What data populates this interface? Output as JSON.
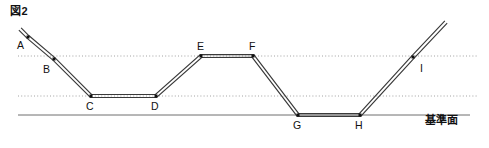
{
  "figure": {
    "title": "図2",
    "width": 489,
    "height": 148,
    "background": "#ffffff",
    "line_color": "#3a3a3a",
    "guide_color": "#8a8a8a",
    "datum_color": "#6e6e6e",
    "text_color": "#111111"
  },
  "datum": {
    "label": "基準面",
    "label_x": 441,
    "label_y": 124,
    "line_y": 115,
    "line_x1": 18,
    "line_x2": 470
  },
  "guides": [
    {
      "name": "upper-guide-line",
      "y": 56,
      "x1": 18,
      "x2": 478,
      "style": "dotted"
    },
    {
      "name": "lower-guide-line",
      "y": 96,
      "x1": 18,
      "x2": 478,
      "style": "dotted"
    }
  ],
  "path": {
    "name": "light-ray-polyline",
    "points": "20,29 28,37 54,59 91,96 156,96 201,56 253,56 298,115 360,115 413,57 446,22",
    "stroke_width": 1.15,
    "double_stroke_offset": 1.6
  },
  "vertices": [
    {
      "id": "A",
      "x": 28,
      "y": 37,
      "label": "A",
      "label_x": 17,
      "label_y": 49,
      "marker": true
    },
    {
      "id": "B",
      "x": 54,
      "y": 59,
      "label": "B",
      "label_x": 43,
      "label_y": 73,
      "marker": true
    },
    {
      "id": "C",
      "x": 91,
      "y": 96,
      "label": "C",
      "label_x": 86,
      "label_y": 110,
      "marker": true
    },
    {
      "id": "D",
      "x": 156,
      "y": 96,
      "label": "D",
      "label_x": 151,
      "label_y": 110,
      "marker": true
    },
    {
      "id": "E",
      "x": 201,
      "y": 56,
      "label": "E",
      "label_x": 197,
      "label_y": 50,
      "marker": true
    },
    {
      "id": "F",
      "x": 253,
      "y": 56,
      "label": "F",
      "label_x": 249,
      "label_y": 50,
      "marker": true
    },
    {
      "id": "G",
      "x": 298,
      "y": 115,
      "label": "G",
      "label_x": 293,
      "label_y": 129,
      "marker": true
    },
    {
      "id": "H",
      "x": 360,
      "y": 115,
      "label": "H",
      "label_x": 355,
      "label_y": 129,
      "marker": true
    },
    {
      "id": "I",
      "x": 413,
      "y": 57,
      "label": "I",
      "label_x": 420,
      "label_y": 72,
      "marker": true
    }
  ]
}
